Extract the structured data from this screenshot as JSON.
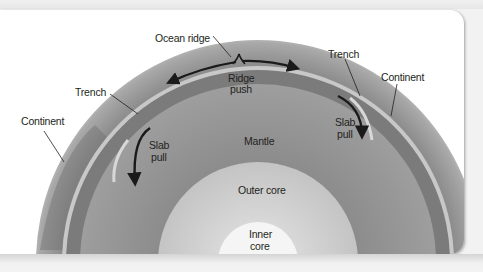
{
  "diagram": {
    "layers": [
      {
        "name": "Inner core",
        "color": "#f4f4f4"
      },
      {
        "name": "Outer core",
        "color": "#cfcfcf"
      },
      {
        "name": "Mantle",
        "color": "#9a9a9a"
      },
      {
        "name": "Asthenosphere band",
        "color": "#7a7a7a"
      },
      {
        "name": "Lithosphere",
        "color": "#b5b5b5"
      }
    ],
    "labels": {
      "ocean_ridge": "Ocean ridge",
      "ridge_push_1": "Ridge",
      "ridge_push_2": "push",
      "trench_left": "Trench",
      "trench_right": "Trench",
      "continent_left": "Continent",
      "continent_right": "Continent",
      "slab_pull_left_1": "Slab",
      "slab_pull_left_2": "pull",
      "slab_pull_right_1": "Slab",
      "slab_pull_right_2": "pull",
      "mantle": "Mantle",
      "outer_core": "Outer core",
      "inner_core_1": "Inner",
      "inner_core_2": "core"
    },
    "arrows": [
      {
        "name": "ridge-push-left",
        "direction": "ridge toward left trench"
      },
      {
        "name": "ridge-push-right",
        "direction": "ridge toward right trench"
      },
      {
        "name": "slab-pull-left",
        "direction": "downward into mantle at left trench"
      },
      {
        "name": "slab-pull-right",
        "direction": "downward into mantle at right trench"
      }
    ],
    "colors": {
      "background": "#ffffff",
      "frame": "#f2f2f2",
      "arrow": "#1a1a1a",
      "text": "#231f20"
    }
  }
}
